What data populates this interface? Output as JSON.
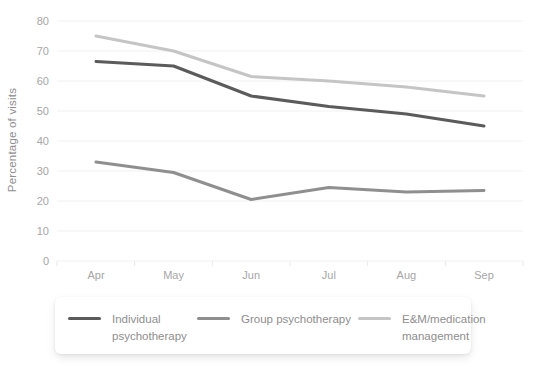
{
  "chart_data": {
    "type": "line",
    "title": "",
    "xlabel": "",
    "ylabel": "Percentage of visits",
    "categories": [
      "Apr",
      "May",
      "Jun",
      "Jul",
      "Aug",
      "Sep"
    ],
    "ylim": [
      0,
      80
    ],
    "ytick_step": 10,
    "grid": true,
    "legend_position": "bottom",
    "series": [
      {
        "name": "Individual psychotherapy",
        "color": "#5b5b5b",
        "values": [
          66.5,
          65.0,
          55.0,
          51.5,
          49.0,
          45.0
        ]
      },
      {
        "name": "Group psychotherapy",
        "color": "#8f8f8f",
        "values": [
          33.0,
          29.5,
          20.5,
          24.5,
          23.0,
          23.5
        ]
      },
      {
        "name": "E&M/medication management",
        "color": "#c5c5c5",
        "values": [
          75.0,
          70.0,
          61.5,
          60.0,
          58.0,
          55.0
        ]
      }
    ]
  },
  "colors": {
    "background": "#ffffff",
    "gridline": "#f1f1f1",
    "tick_mark": "#e9e9e9",
    "axis_text": "#a6a6a6",
    "legend_text": "#8e8e8e"
  }
}
